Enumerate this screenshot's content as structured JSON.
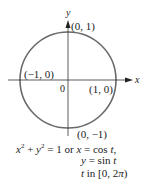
{
  "diagram": {
    "axes": {
      "x_label": "x",
      "y_label": "y",
      "origin_label": "0"
    },
    "points": [
      {
        "label": "(0, 1)"
      },
      {
        "label": "(−1, 0)"
      },
      {
        "label": "(1, 0)"
      },
      {
        "label": "(0, −1)"
      }
    ],
    "circle_color": "#6a6a6a",
    "axis_color": "#333333"
  },
  "caption": {
    "line1_a": "x",
    "line1_b": "2",
    "line1_c": " + ",
    "line1_d": "y",
    "line1_e": "2",
    "line1_f": " = 1 or ",
    "line1_g": "x",
    "line1_h": " = cos ",
    "line1_i": "t,",
    "line2_a": "y",
    "line2_b": " = sin ",
    "line2_c": "t",
    "line3_a": "t",
    "line3_b": " in [0, 2",
    "line3_c": "π",
    "line3_d": ")"
  }
}
